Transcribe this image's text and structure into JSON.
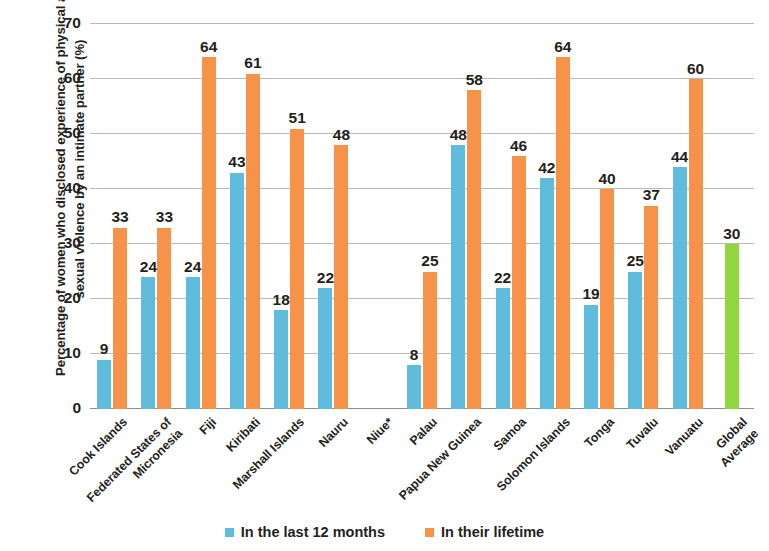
{
  "chart_data": {
    "type": "bar",
    "title": "",
    "xlabel": "",
    "ylabel": "Percentage of women who disclosed experience of physical and/or sexual violence by an intimate partner (%)",
    "ylim": [
      0,
      70
    ],
    "yticks": [
      0,
      10,
      20,
      30,
      40,
      50,
      60,
      70
    ],
    "ytick_labels": [
      "0",
      "10",
      "20",
      "30",
      "40",
      "50",
      "60",
      "70"
    ],
    "grid": true,
    "legend_position": "bottom",
    "categories": [
      "Cook Islands",
      "Federated States of Micronesia",
      "Fiji",
      "Kiribati",
      "Marshall Islands",
      "Nauru",
      "Niue*",
      "Palau",
      "Papua New Guinea",
      "Samoa",
      "Solomon Islands",
      "Tonga",
      "Tuvalu",
      "Vanuatu",
      "Global Average"
    ],
    "series": [
      {
        "name": "In the last 12 months",
        "color": "#5fbcdd",
        "values": [
          9,
          24,
          24,
          43,
          18,
          22,
          null,
          8,
          48,
          22,
          42,
          19,
          25,
          44,
          null
        ]
      },
      {
        "name": "In their lifetime",
        "color": "#f79348",
        "values": [
          33,
          33,
          64,
          61,
          51,
          48,
          null,
          25,
          58,
          46,
          64,
          40,
          37,
          60,
          null
        ]
      },
      {
        "name": "Global Average",
        "color": "#8fd63f",
        "values": [
          null,
          null,
          null,
          null,
          null,
          null,
          null,
          null,
          null,
          null,
          null,
          null,
          null,
          null,
          30
        ]
      }
    ]
  },
  "axis": {
    "y_title": "Percentage of women who disclosed experience of\nphysical and/or sexual violence by an intimate partner\n(%)"
  },
  "legend": {
    "items": [
      {
        "label": "In the last 12 months",
        "color": "#5fbcdd"
      },
      {
        "label": "In their lifetime",
        "color": "#f79348"
      }
    ]
  }
}
